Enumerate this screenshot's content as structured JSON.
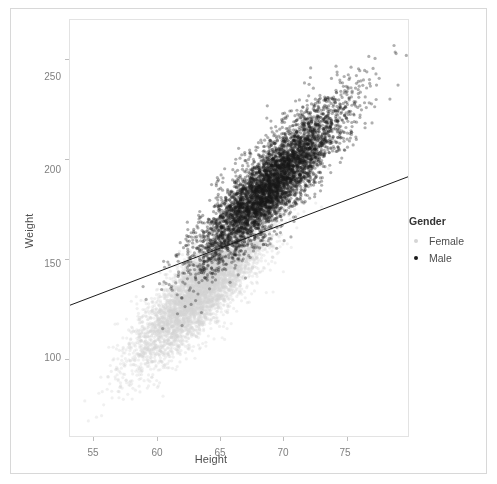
{
  "figure": {
    "background": "#ffffff",
    "border_color": "#d8d8d8"
  },
  "axis": {
    "x_title": "Height",
    "y_title": "Weight",
    "x_ticks": [
      "55",
      "60",
      "65",
      "70",
      "75"
    ],
    "y_ticks": [
      "100",
      "150",
      "200",
      "250"
    ],
    "tick_color": "#7f7f7f",
    "title_color": "#4d4d4d"
  },
  "legend": {
    "title": "Gender",
    "entries": [
      {
        "label": "Female",
        "color": "#d5d5d5",
        "key_name": "legend-key-female"
      },
      {
        "label": "Male",
        "color": "#1a1a1a",
        "key_name": "legend-key-male"
      }
    ]
  },
  "chart_data": {
    "type": "scatter",
    "title": "",
    "xlabel": "Height",
    "ylabel": "Weight",
    "xlim": [
      53.1,
      79.9
    ],
    "ylim": [
      61,
      270
    ],
    "x_ticks": [
      55,
      60,
      65,
      70,
      75
    ],
    "y_ticks": [
      100,
      150,
      200,
      250
    ],
    "grid": false,
    "legend_position": "right",
    "legend_title": "Gender",
    "point_size": 1.6,
    "point_alpha": 0.35,
    "series": [
      {
        "name": "Female",
        "color": "#d5d5d5",
        "n": 5000,
        "x_mean": 63.7,
        "x_sd": 2.7,
        "y_mean": 135.9,
        "y_sd": 19.0,
        "correlation": 0.85
      },
      {
        "name": "Male",
        "color": "#1a1a1a",
        "n": 5000,
        "x_mean": 69.0,
        "x_sd": 2.85,
        "y_mean": 187.0,
        "y_sd": 19.8,
        "correlation": 0.86
      }
    ],
    "fit_line": {
      "name": "linear-fit",
      "color": "#1a1a1a",
      "width": 1,
      "x0": 53.1,
      "y0": 126.7,
      "x1": 79.9,
      "y1": 191.3,
      "slope": 2.41,
      "intercept": -1.2
    }
  }
}
